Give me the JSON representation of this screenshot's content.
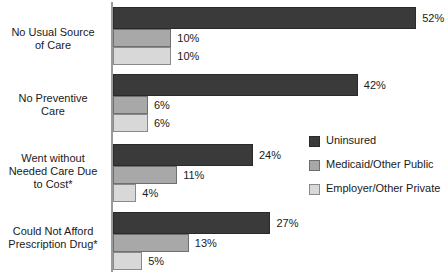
{
  "chart_data": {
    "type": "bar",
    "orientation": "horizontal",
    "title": "",
    "xlabel": "",
    "ylabel": "",
    "grid": false,
    "legend_position": "right-middle",
    "xlim": [
      0,
      57
    ],
    "value_suffix": "%",
    "categories": [
      "No Usual Source of Care",
      "No Preventive Care",
      "Went without Needed Care Due to Cost*",
      "Could Not Afford Prescription Drug*"
    ],
    "category_lines": [
      [
        "No Usual Source",
        "of Care"
      ],
      [
        "No Preventive",
        "Care"
      ],
      [
        "Went without",
        "Needed Care Due",
        "to Cost*"
      ],
      [
        "Could Not Afford",
        "Prescription Drug*"
      ]
    ],
    "series": [
      {
        "name": "Uninsured",
        "color": "#3a3a3a",
        "values": [
          52,
          42,
          24,
          27
        ],
        "labels": [
          "52%",
          "42%",
          "24%",
          "27%"
        ]
      },
      {
        "name": "Medicaid/Other Public",
        "color": "#a8a8a8",
        "values": [
          10,
          6,
          11,
          13
        ],
        "labels": [
          "10%",
          "6%",
          "11%",
          "13%"
        ]
      },
      {
        "name": "Employer/Other Private",
        "color": "#d8d8d8",
        "values": [
          10,
          6,
          4,
          5
        ],
        "labels": [
          "10%",
          "6%",
          "4%",
          "5%"
        ]
      }
    ]
  },
  "legend": {
    "items": [
      {
        "label": "Uninsured"
      },
      {
        "label": "Medicaid/Other Public"
      },
      {
        "label": "Employer/Other Private"
      }
    ]
  }
}
